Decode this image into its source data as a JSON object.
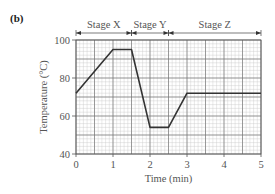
{
  "panel_label": "(b)",
  "chart_data": {
    "type": "line",
    "title": "",
    "xlabel": "Time (min)",
    "ylabel": "Temperature (°C)",
    "xlim": [
      0,
      5
    ],
    "ylim": [
      40,
      100
    ],
    "x_ticks": [
      0,
      1,
      2,
      3,
      4,
      5
    ],
    "x_tick_labels": [
      "0",
      "1",
      "2",
      "3",
      "4",
      "5"
    ],
    "y_ticks": [
      40,
      60,
      80,
      100
    ],
    "y_tick_labels": [
      "40",
      "60",
      "80",
      "100"
    ],
    "grid": true,
    "legend": null,
    "series": [
      {
        "name": "Temperature",
        "x": [
          0,
          1.0,
          1.5,
          2.0,
          2.5,
          3.0,
          5.0
        ],
        "y": [
          72,
          95,
          95,
          54,
          54,
          72,
          72
        ]
      }
    ],
    "annotations": [
      {
        "label": "Stage X",
        "x_start": 0,
        "x_end": 1.5
      },
      {
        "label": "Stage Y",
        "x_start": 1.5,
        "x_end": 2.5
      },
      {
        "label": "Stage Z",
        "x_start": 2.5,
        "x_end": 5
      }
    ]
  }
}
